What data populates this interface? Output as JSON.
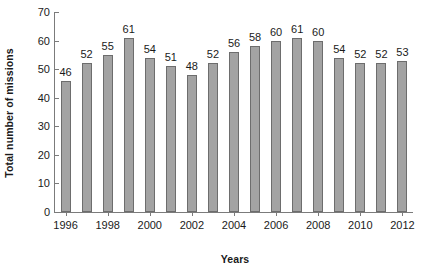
{
  "chart_data": {
    "type": "bar",
    "title": "",
    "xlabel": "Years",
    "ylabel": "Total number of missions",
    "categories": [
      "1996",
      "1997",
      "1998",
      "1999",
      "2000",
      "2001",
      "2002",
      "2003",
      "2004",
      "2005",
      "2006",
      "2007",
      "2008",
      "2009",
      "2010",
      "2011",
      "2012"
    ],
    "values": [
      46,
      52,
      55,
      61,
      54,
      51,
      48,
      52,
      56,
      58,
      60,
      61,
      60,
      54,
      52,
      52,
      53
    ],
    "data_labels": [
      "46",
      "52",
      "55",
      "61",
      "54",
      "51",
      "48",
      "52",
      "56",
      "58",
      "60",
      "61",
      "60",
      "54",
      "52",
      "52",
      "53"
    ],
    "ylim": [
      0,
      70
    ],
    "yticks": [
      0,
      10,
      20,
      30,
      40,
      50,
      60,
      70
    ],
    "ytick_labels": [
      "0",
      "10",
      "20",
      "30",
      "40",
      "50",
      "60",
      "70"
    ],
    "xtick_categories": [
      "1996",
      "1998",
      "2000",
      "2002",
      "2004",
      "2006",
      "2008",
      "2010",
      "2012"
    ],
    "xtick_labels": [
      "1996",
      "1998",
      "2000",
      "2002",
      "2004",
      "2006",
      "2008",
      "2010",
      "2012"
    ],
    "grid": false,
    "legend": null,
    "legend_position": "none",
    "bar_color": "#a3a3a3",
    "bar_edge_color": "#6d6d6d",
    "axis_color": "#7b7b7b",
    "text_color": "#1a1a1a",
    "background_color": "#ffffff"
  }
}
